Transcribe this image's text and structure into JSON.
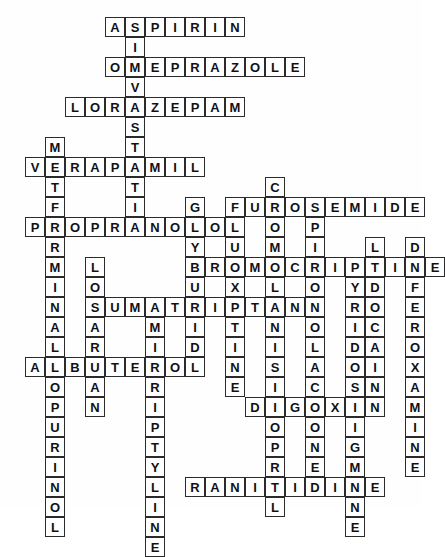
{
  "puzzle": {
    "title": "Pharmacology Medication Crossword",
    "type": "crossword-grid",
    "cell_size_px": 20,
    "origin_x_px": 5,
    "origin_y_px": 17,
    "grid_columns": 21,
    "grid_rows": 25,
    "colors": {
      "cell_background": "#ffffff",
      "cell_border": "#2b2b2b",
      "letter_color": "#111111",
      "page_background": "#fefefe"
    },
    "entries": [
      {
        "id": "aspirin",
        "answer": "ASPIRIN",
        "direction": "across",
        "row": 0,
        "col": 5,
        "length": 7
      },
      {
        "id": "omeprazole",
        "answer": "OMEPRAZOLE",
        "direction": "across",
        "row": 2,
        "col": 5,
        "length": 10
      },
      {
        "id": "lorazepam",
        "answer": "LORAZEPAM",
        "direction": "across",
        "row": 4,
        "col": 3,
        "length": 9
      },
      {
        "id": "verapamil",
        "answer": "VERAPAMIL",
        "direction": "across",
        "row": 7,
        "col": 1,
        "length": 9
      },
      {
        "id": "furosemide",
        "answer": "FUROSEMIDE",
        "direction": "across",
        "row": 9,
        "col": 11,
        "length": 10
      },
      {
        "id": "propranolol",
        "answer": "PROPRANOLOL",
        "direction": "across",
        "row": 10,
        "col": 1,
        "length": 11
      },
      {
        "id": "bromocriptine",
        "answer": "BROMOCRIPTINE",
        "direction": "across",
        "row": 12,
        "col": 9,
        "length": 13
      },
      {
        "id": "sumatriptan",
        "answer": "SUMATRIPTAN",
        "direction": "across",
        "row": 14,
        "col": 4,
        "length": 11
      },
      {
        "id": "albuterol",
        "answer": "ALBUTEROL",
        "direction": "across",
        "row": 17,
        "col": 1,
        "length": 9
      },
      {
        "id": "digoxin",
        "answer": "DIGOXIN",
        "direction": "across",
        "row": 19,
        "col": 12,
        "length": 7
      },
      {
        "id": "ranitidine",
        "answer": "RANITIDINE",
        "direction": "across",
        "row": 23,
        "col": 9,
        "length": 10
      },
      {
        "id": "simvastatin",
        "answer": "SIMVASTATIN",
        "direction": "down",
        "row": 0,
        "col": 6,
        "length": 11
      },
      {
        "id": "metformin",
        "answer": "METFORMIN",
        "direction": "down",
        "row": 6,
        "col": 2,
        "length": 9
      },
      {
        "id": "cromolyn",
        "answer": "CROMOLYN",
        "direction": "down",
        "row": 8,
        "col": 13,
        "length": 8
      },
      {
        "id": "glyburide",
        "answer": "GLYBURIDE",
        "direction": "down",
        "row": 9,
        "col": 9,
        "length": 9
      },
      {
        "id": "fluoxetine",
        "answer": "FLUOXETINE",
        "direction": "down",
        "row": 9,
        "col": 11,
        "length": 10
      },
      {
        "id": "spironolactone",
        "answer": "SPIRONOLACTONE",
        "direction": "down",
        "row": 9,
        "col": 15,
        "length": 14
      },
      {
        "id": "lidocaine",
        "answer": "LIDOCAINE",
        "direction": "down",
        "row": 11,
        "col": 18,
        "length": 9
      },
      {
        "id": "deferoxamine",
        "answer": "DEFEROXAMINE",
        "direction": "down",
        "row": 11,
        "col": 20,
        "length": 12
      },
      {
        "id": "pyridostigmine",
        "answer": "PYRIDOSTIGMINE",
        "direction": "down",
        "row": 12,
        "col": 17,
        "length": 14
      },
      {
        "id": "losartan",
        "answer": "LOSARTAN",
        "direction": "down",
        "row": 12,
        "col": 4,
        "length": 8
      },
      {
        "id": "amitriptyline",
        "answer": "AMITRIPTYLINE",
        "direction": "down",
        "row": 14,
        "col": 7,
        "length": 13
      },
      {
        "id": "lisinopril",
        "answer": "LISINOPRIL",
        "direction": "down",
        "row": 15,
        "col": 13,
        "length": 10
      },
      {
        "id": "allopurinol",
        "answer": "ALLOPURINOL",
        "direction": "down",
        "row": 15,
        "col": 2,
        "length": 11
      }
    ]
  }
}
